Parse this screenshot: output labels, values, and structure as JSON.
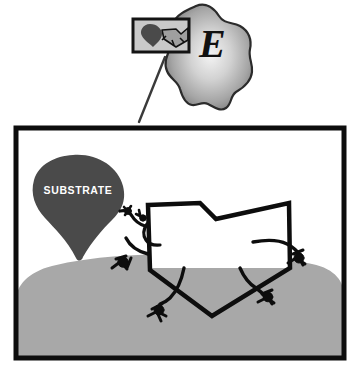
{
  "figure": {
    "background_color": "#ffffff"
  },
  "enzyme": {
    "letter": "E",
    "letter_color": "#111111",
    "body_fill_light": "#f2f2f2",
    "body_fill_mid": "#a9a9a9",
    "body_fill_dark": "#6e6e6e",
    "outline_color": "#2b2b2b",
    "name": "enzyme-blob"
  },
  "inset": {
    "name": "active-site-inset-box",
    "border_color": "#1a1a1a",
    "fill_color": "#b5b5b5",
    "substrate_color": "#4a4a4a",
    "inhibitor_color": "#a0a0a0"
  },
  "leader_line": {
    "name": "leader-line",
    "color": "#3a3a3a"
  },
  "panel": {
    "name": "main-panel",
    "frame_color": "#0d0d0d",
    "background_color": "#ffffff",
    "surface_color": "#a8a8a8",
    "surface_label": "enzyme surface"
  },
  "substrate": {
    "label": "SUBSTRATE",
    "fill_color": "#4a4a4a",
    "text_color": "#ffffff"
  },
  "inhibitor": {
    "label_line1": "REVERSIBLE",
    "label_line2": "INHIBITOR",
    "outline_color": "#0d0d0d",
    "fill_upper_color": "#ffffff",
    "fill_lower_color": "#a8a8a8",
    "text_color": "#ffffff"
  },
  "binding_sites": {
    "color": "#0d0d0d",
    "count": 5,
    "names": [
      "binding-site-substrate-left",
      "binding-site-left",
      "binding-site-bottom",
      "binding-site-right-lower",
      "binding-site-right-upper"
    ]
  }
}
